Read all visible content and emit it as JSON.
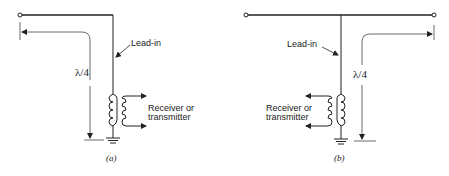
{
  "figure": {
    "panels": [
      {
        "id": "a",
        "caption": "(a)",
        "lead_in_label": "Lead-in",
        "dimension_label": "λ/4",
        "device_label_line1": "Receiver or",
        "device_label_line2": "transmitter"
      },
      {
        "id": "b",
        "caption": "(b)",
        "lead_in_label": "Lead-in",
        "dimension_label": "λ/4",
        "device_label_line1": "Receiver or",
        "device_label_line2": "transmitter"
      }
    ],
    "colors": {
      "line": "#222222",
      "dimension": "#444444",
      "background": "#ffffff"
    }
  }
}
